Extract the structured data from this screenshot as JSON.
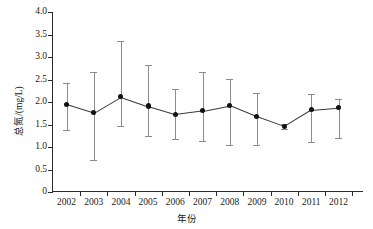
{
  "chart_data": {
    "type": "line",
    "title": "",
    "xlabel": "年份",
    "ylabel": "总氮/(mg/L)",
    "categories": [
      "2002",
      "2003",
      "2004",
      "2005",
      "2006",
      "2007",
      "2008",
      "2009",
      "2010",
      "2011",
      "2012"
    ],
    "values": [
      1.95,
      1.76,
      2.12,
      1.91,
      1.73,
      1.81,
      1.93,
      1.68,
      1.46,
      1.83,
      1.88
    ],
    "error_upper": [
      2.42,
      2.67,
      3.35,
      2.82,
      2.28,
      2.67,
      2.52,
      2.19,
      1.52,
      2.17,
      2.06
    ],
    "error_lower": [
      1.37,
      0.71,
      1.47,
      1.25,
      1.17,
      1.14,
      1.04,
      1.04,
      1.41,
      1.12,
      1.21
    ],
    "error_type": "mean ± SD",
    "ylim": [
      0,
      4.0
    ],
    "yticks": [
      "0",
      "0.5",
      "1.0",
      "1.5",
      "2.0",
      "2.5",
      "3.0",
      "3.5",
      "4.0"
    ],
    "ytick_values": [
      0,
      0.5,
      1.0,
      1.5,
      2.0,
      2.5,
      3.0,
      3.5,
      4.0
    ],
    "xlim": [
      2001.5,
      2012.5
    ],
    "grid": false,
    "legend": "none",
    "marker_color": "#111111",
    "line_color": "#3a3a3a",
    "errorbar_color": "#8c8c8c",
    "axis_color": "#2a2a2a",
    "background": "#ffffff"
  }
}
